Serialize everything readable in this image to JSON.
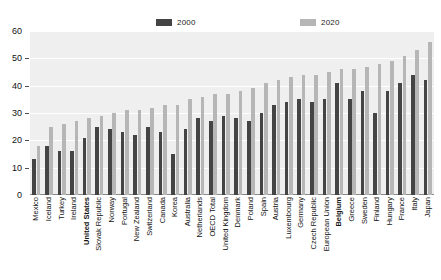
{
  "chart_data": {
    "type": "bar",
    "title": "",
    "subtitle": "",
    "xlabel": "",
    "ylabel": "",
    "ylim": [
      0,
      60
    ],
    "ytick_step": 10,
    "yticks": [
      0,
      10,
      20,
      30,
      40,
      50,
      60
    ],
    "grid": true,
    "legend_position": "top-center",
    "orientation": "vertical",
    "bar_style": "grouped",
    "sorted_by": "2020 ascending",
    "categories": [
      "Mexico",
      "Iceland",
      "Turkey",
      "Ireland",
      "United States",
      "Slovak Republic",
      "Norway",
      "Portugal",
      "New Zealand",
      "Switzerland",
      "Canada",
      "Korea",
      "Australia",
      "Netherlands",
      "OECD Total",
      "United Kingdom",
      "Denmark",
      "Poland",
      "Spain",
      "Austria",
      "Luxembourg",
      "Germany",
      "Czech Republic",
      "European Union",
      "Belgium",
      "Greece",
      "Sweden",
      "Finland",
      "Hungary",
      "France",
      "Italy",
      "Japan"
    ],
    "highlighted_categories": [
      "United States",
      "Belgium"
    ],
    "series": [
      {
        "name": "2000",
        "color": "#444444",
        "values": [
          13,
          18,
          16,
          16,
          21,
          25,
          24,
          23,
          22,
          25,
          23,
          15,
          24,
          28,
          27,
          29,
          28,
          27,
          30,
          33,
          34,
          35,
          34,
          35,
          41,
          35,
          38,
          30,
          38,
          41,
          44,
          42
        ]
      },
      {
        "name": "2020",
        "color": "#b6b6b6",
        "values": [
          18,
          25,
          26,
          27,
          28,
          29,
          30,
          31,
          31,
          32,
          33,
          33,
          35,
          36,
          37,
          37,
          38,
          39,
          41,
          42,
          43,
          44,
          44,
          45,
          46,
          46,
          47,
          48,
          49,
          51,
          53,
          56
        ]
      }
    ]
  },
  "legend": {
    "items": [
      {
        "label": "2000",
        "color": "#444444"
      },
      {
        "label": "2020",
        "color": "#b6b6b6"
      }
    ]
  },
  "colors": {
    "series_2000": "#444444",
    "series_2020": "#b6b6b6",
    "plot_background": "#efefef",
    "gridline": "#ffffff",
    "text": "#111111"
  }
}
